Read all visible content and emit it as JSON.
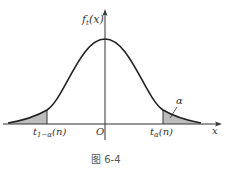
{
  "figure": {
    "caption": "图 6-4",
    "y_axis_label": "f",
    "y_axis_label_sub": "t",
    "y_axis_label_arg": "(x)",
    "x_axis_label": "x",
    "origin_label": "O",
    "left_quantile_label": "t",
    "left_quantile_sub": "1−α",
    "left_quantile_arg": "(n)",
    "right_quantile_label": "t",
    "right_quantile_sub": "α",
    "right_quantile_arg": "(n)",
    "tail_area_label": "α",
    "colors": {
      "curve": "#222222",
      "axis": "#333333",
      "shade": "#bdbdbd"
    }
  }
}
